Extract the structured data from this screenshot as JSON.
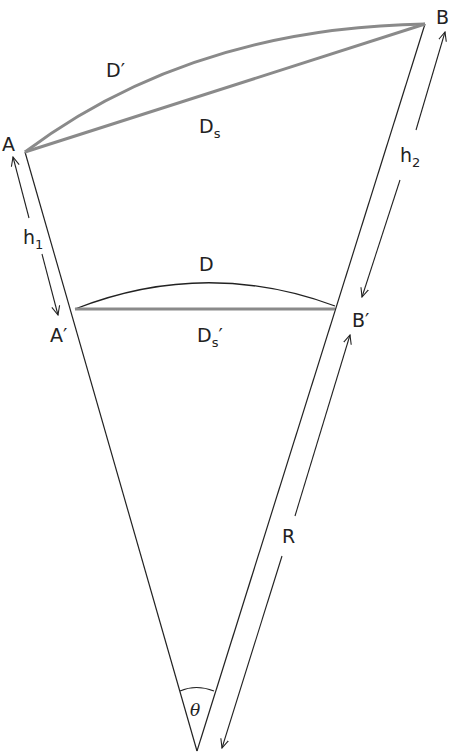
{
  "diagram": {
    "labels": {
      "A": "A",
      "B": "B",
      "A_prime": "A′",
      "B_prime": "B′",
      "D_prime": "D′",
      "D_s_main": "D",
      "D_s_sub": "s",
      "D": "D",
      "D_s_prime_main": "D",
      "D_s_prime_sub": "s",
      "D_s_prime_mark": "′",
      "h1_main": "h",
      "h1_sub": "1",
      "h2_main": "h",
      "h2_sub": "2",
      "R": "R",
      "theta": "θ"
    },
    "colors": {
      "line": "#222222",
      "thick_line": "#8a8a8a"
    }
  }
}
